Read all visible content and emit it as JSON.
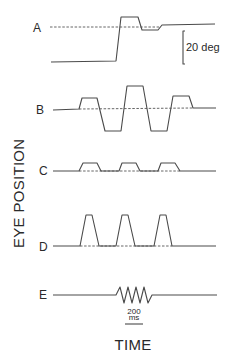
{
  "figure": {
    "y_axis_label": "EYE POSITION",
    "x_axis_label": "TIME",
    "amplitude_scale": {
      "label": "20 deg"
    },
    "time_scale": {
      "value": "200",
      "unit": "ms"
    },
    "rows": [
      {
        "label": "A"
      },
      {
        "label": "B"
      },
      {
        "label": "C"
      },
      {
        "label": "D"
      },
      {
        "label": "E"
      }
    ],
    "colors": {
      "trace": "#4a4a4a",
      "text": "#2a2a2a",
      "background": "#ffffff"
    }
  }
}
